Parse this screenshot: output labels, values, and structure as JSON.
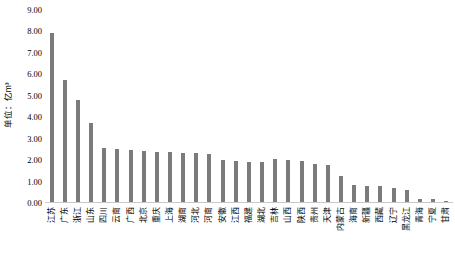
{
  "chart_data": {
    "type": "bar",
    "title": "",
    "subtitle": "",
    "xlabel": "",
    "ylabel": "单位：亿m³",
    "ylim": [
      0,
      9
    ],
    "ytick_step": 1,
    "ytick_labels": [
      "9.00",
      "8.00",
      "7.00",
      "6.00",
      "5.00",
      "4.00",
      "3.00",
      "2.00",
      "1.00",
      "0.00"
    ],
    "ytick_values": [
      9,
      8,
      7,
      6,
      5,
      4,
      3,
      2,
      1,
      0
    ],
    "grid": false,
    "legend": false,
    "legend_position": "none",
    "bar_color": "#7b7b7b",
    "axis_color": "#c9c9c9",
    "categories": [
      "江苏",
      "广东",
      "浙江",
      "山东",
      "四川",
      "云南",
      "广西",
      "北京",
      "重庆",
      "上海",
      "湖南",
      "河北",
      "河南",
      "安徽",
      "江西",
      "福建",
      "湖北",
      "吉林",
      "山西",
      "陕西",
      "贵州",
      "天津",
      "内蒙古",
      "海南",
      "新疆",
      "西藏",
      "辽宁",
      "黑龙江",
      "青海",
      "宁夏",
      "甘肃"
    ],
    "values": [
      7.95,
      5.75,
      4.8,
      3.75,
      2.55,
      2.5,
      2.45,
      2.42,
      2.4,
      2.38,
      2.35,
      2.33,
      2.3,
      2.0,
      1.95,
      1.92,
      1.9,
      2.05,
      2.02,
      1.98,
      1.8,
      1.75,
      1.28,
      0.85,
      0.8,
      0.78,
      0.72,
      0.62,
      0.2,
      0.2,
      0.08
    ]
  }
}
